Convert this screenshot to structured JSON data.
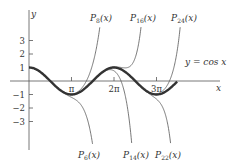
{
  "chart_data": {
    "type": "line",
    "title": "",
    "xlabel": "x",
    "ylabel": "y",
    "x_ticks": [
      {
        "label": "π",
        "value": 3.14159
      },
      {
        "label": "2π",
        "value": 6.28319
      },
      {
        "label": "3π",
        "value": 9.42478
      }
    ],
    "y_ticks": [
      {
        "label": "3",
        "value": 3
      },
      {
        "label": "2",
        "value": 2
      },
      {
        "label": "1",
        "value": 1
      },
      {
        "label": "−1",
        "value": -1
      },
      {
        "label": "−2",
        "value": -2
      },
      {
        "label": "−3",
        "value": -3
      }
    ],
    "xlim": [
      0,
      11.5
    ],
    "ylim": [
      -4.9,
      4.1
    ],
    "grid": false,
    "series": [
      {
        "name": "y = cos x",
        "function": "cos",
        "bold": true
      },
      {
        "name": "P6(x)",
        "degree": 6,
        "label_position": "bottom"
      },
      {
        "name": "P8(x)",
        "degree": 8,
        "label_position": "top"
      },
      {
        "name": "P14(x)",
        "degree": 14,
        "label_position": "bottom"
      },
      {
        "name": "P16(x)",
        "degree": 16,
        "label_position": "top"
      },
      {
        "name": "P22(x)",
        "degree": 22,
        "label_position": "bottom"
      },
      {
        "name": "P24(x)",
        "degree": 24,
        "label_position": "top"
      }
    ],
    "annotations": [
      {
        "text": "y = cos x"
      }
    ]
  },
  "labels": {
    "y_axis": "y",
    "x_axis": "x",
    "cos_label": "y = cos x",
    "top": [
      {
        "sub": "8"
      },
      {
        "sub": "16"
      },
      {
        "sub": "24"
      }
    ],
    "bottom": [
      {
        "sub": "6"
      },
      {
        "sub": "14"
      },
      {
        "sub": "22"
      }
    ],
    "P": "P",
    "arg": "(x)"
  },
  "colors": {
    "axis": "#555555",
    "curve": "#333333",
    "poly": "#555555"
  }
}
